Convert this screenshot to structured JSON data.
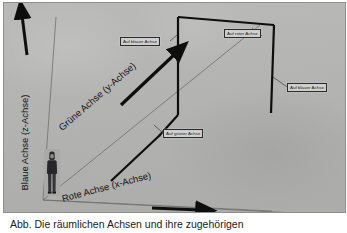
{
  "figure": {
    "background_color": "#b5b5b3",
    "ink_color": "#141414",
    "callout_fill": "#cfcfcd",
    "caption": "Abb.   Die räumlichen Achsen und ihre zugehörigen"
  },
  "axes": [
    {
      "id": "blue",
      "label": "Blaue Achse (z-Achse)",
      "direction": "up",
      "color_name": "blau"
    },
    {
      "id": "green",
      "label": "Grüne Achse (y-Achse)",
      "direction": "diagonal-up-right",
      "color_name": "grün"
    },
    {
      "id": "red",
      "label": "Rote Achse (x-Achse)",
      "direction": "right",
      "color_name": "rot"
    }
  ],
  "callouts": [
    {
      "id": "auf-blauer-achse-links",
      "text": "Auf blauer Achse"
    },
    {
      "id": "auf-roter-achse",
      "text": "Auf roter Achse"
    },
    {
      "id": "auf-blauer-achse-rechts",
      "text": "Auf blauer Achse"
    },
    {
      "id": "auf-gruener-achse",
      "text": "Auf grüner Achse"
    }
  ],
  "scale_figure": {
    "name": "human-silhouette",
    "description": "Person"
  }
}
